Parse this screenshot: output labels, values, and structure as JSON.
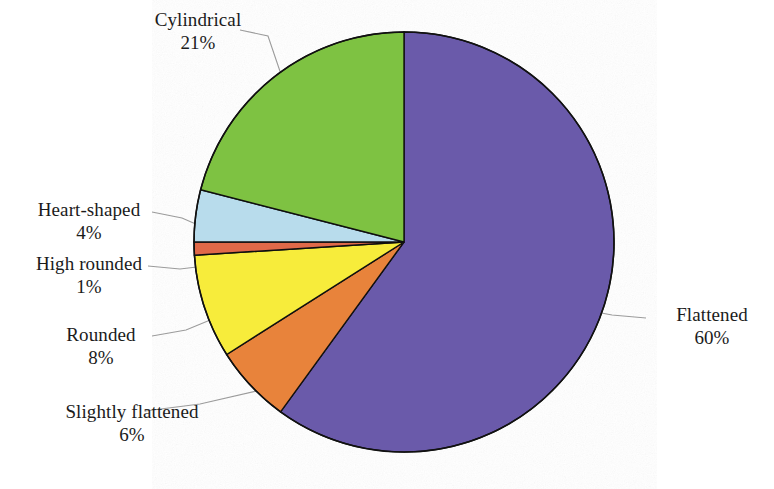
{
  "figure": {
    "kind": "pie-chart",
    "background_color": "#ffffff",
    "outline_color": "#111111",
    "leader_line_color": "#9a9a9a",
    "text_color": "#1b1b1b"
  },
  "chart_data": {
    "type": "pie",
    "title": "",
    "subtitle": "",
    "xlabel": "",
    "ylabel": "",
    "legend_position": "none",
    "grid": false,
    "start_angle_deg": 0,
    "direction": "clockwise",
    "units": "percent",
    "total": 100,
    "categories": [
      "Flattened",
      "Slightly flattened",
      "Rounded",
      "High rounded",
      "Heart-shaped",
      "Cylindrical"
    ],
    "values": [
      60,
      6,
      8,
      1,
      4,
      21
    ],
    "colors": [
      "#6a5aaa",
      "#e8833a",
      "#f7ec3a",
      "#e0694a",
      "#b8dcec",
      "#7ec242"
    ],
    "slices": [
      {
        "name": "Flattened",
        "value": 60,
        "label": "Flattened",
        "percent_label": "60%",
        "color": "#6a5aaa"
      },
      {
        "name": "Slightly flattened",
        "value": 6,
        "label": "Slightly flattened",
        "percent_label": "6%",
        "color": "#e8833a"
      },
      {
        "name": "Rounded",
        "value": 8,
        "label": "Rounded",
        "percent_label": "8%",
        "color": "#f7ec3a"
      },
      {
        "name": "High rounded",
        "value": 1,
        "label": "High rounded",
        "percent_label": "1%",
        "color": "#e0694a"
      },
      {
        "name": "Heart-shaped",
        "value": 4,
        "label": "Heart-shaped",
        "percent_label": "4%",
        "color": "#b8dcec"
      },
      {
        "name": "Cylindrical",
        "value": 21,
        "label": "Cylindrical",
        "percent_label": "21%",
        "color": "#7ec242"
      }
    ]
  },
  "labels": {
    "cylindrical": {
      "name": "Cylindrical",
      "percent": "21%"
    },
    "heart_shaped": {
      "name": "Heart-shaped",
      "percent": "4%"
    },
    "high_rounded": {
      "name": "High rounded",
      "percent": "1%"
    },
    "rounded": {
      "name": "Rounded",
      "percent": "8%"
    },
    "slightly_flattened": {
      "name": "Slightly flattened",
      "percent": "6%"
    },
    "flattened": {
      "name": "Flattened",
      "percent": "60%"
    }
  }
}
